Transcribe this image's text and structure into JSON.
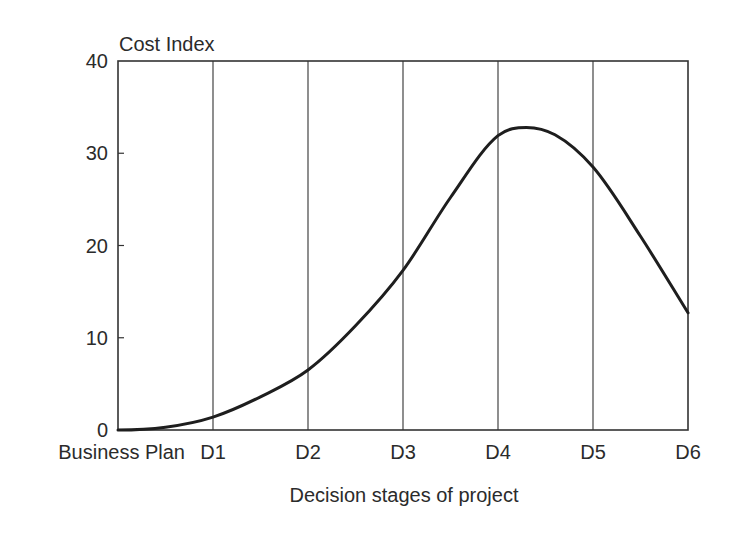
{
  "chart_data": {
    "type": "line",
    "title": "",
    "ylabel": "Cost Index",
    "xlabel": "Decision stages of project",
    "ylim": [
      0,
      40
    ],
    "yticks": [
      0,
      10,
      20,
      30,
      40
    ],
    "ytick_labels": [
      "0",
      "10",
      "20",
      "30",
      "40"
    ],
    "categories": [
      "Business Plan",
      "D1",
      "D2",
      "D3",
      "D4",
      "D5",
      "D6"
    ],
    "grid": {
      "vertical": true,
      "horizontal": false
    },
    "legend": null,
    "series": [
      {
        "name": "Cost Index",
        "x": [
          0,
          0.5,
          1,
          1.5,
          2,
          2.5,
          3,
          3.5,
          4,
          4.3,
          4.6,
          5,
          5.5,
          6
        ],
        "values": [
          0,
          0.3,
          1.4,
          3.6,
          6.5,
          11.3,
          17.3,
          25.2,
          31.9,
          32.8,
          32.0,
          28.5,
          21.0,
          12.7
        ]
      }
    ],
    "annotations": []
  },
  "labels": {
    "y_axis_title": "Cost Index",
    "x_axis_title": "Decision stages of project"
  },
  "colors": {
    "line": "#1e1e1e",
    "axis": "#333333",
    "gridline": "#444444",
    "text": "#2b2b2b",
    "background": "#ffffff"
  }
}
